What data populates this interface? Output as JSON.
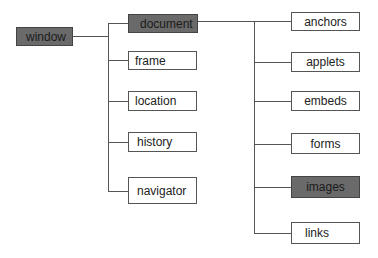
{
  "diagram": {
    "root": {
      "label": "window",
      "highlighted": true
    },
    "window_children": [
      {
        "label": "document",
        "highlighted": true
      },
      {
        "label": "frame",
        "highlighted": false
      },
      {
        "label": "location",
        "highlighted": false
      },
      {
        "label": "history",
        "highlighted": false
      },
      {
        "label": "navigator",
        "highlighted": false
      }
    ],
    "document_children": [
      {
        "label": "anchors",
        "highlighted": false
      },
      {
        "label": "applets",
        "highlighted": false
      },
      {
        "label": "embeds",
        "highlighted": false
      },
      {
        "label": "forms",
        "highlighted": false
      },
      {
        "label": "images",
        "highlighted": true
      },
      {
        "label": "links",
        "highlighted": false
      }
    ],
    "colors": {
      "highlight": "#6a6a6a",
      "line": "#555555",
      "background": "#ffffff"
    }
  }
}
